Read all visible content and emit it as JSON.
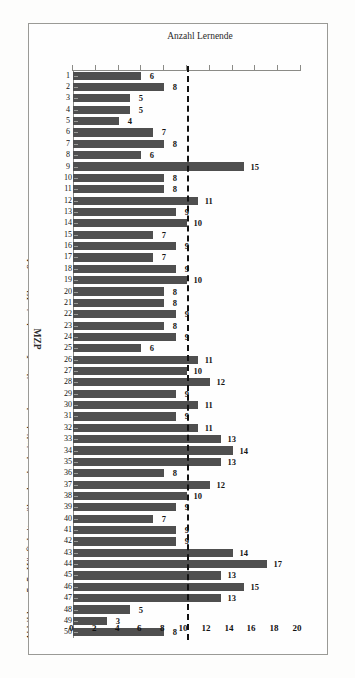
{
  "figure": {
    "caption": "Abbildung 5–5: Häufigkeiten überdurchschnittlich gelangweilter Lernender in Klasse 9A."
  },
  "colors": {
    "bar": "#4f4f4f",
    "reference_line": "#111111",
    "axis": "#8b8b87",
    "background": "#fefefe"
  },
  "chart_data": {
    "type": "bar",
    "title": "",
    "subtitle": "",
    "orientation": "vertical",
    "xlabel": "MZP",
    "ylabel": "Anzahl Lernende",
    "ylim": [
      0,
      20
    ],
    "ytick_labels": [
      "0",
      "2",
      "4",
      "6",
      "8",
      "10",
      "12",
      "14",
      "16",
      "18",
      "20"
    ],
    "ytick_values": [
      0,
      2,
      4,
      6,
      8,
      10,
      12,
      14,
      16,
      18,
      20
    ],
    "grid": false,
    "legend": "none",
    "annotations": [
      {
        "type": "reference-line",
        "style": "dashed",
        "value": 10,
        "label": ""
      }
    ],
    "categories": [
      "1",
      "2",
      "3",
      "4",
      "5",
      "6",
      "7",
      "8",
      "9",
      "10",
      "11",
      "12",
      "13",
      "14",
      "15",
      "16",
      "17",
      "18",
      "19",
      "20",
      "21",
      "22",
      "23",
      "24",
      "25",
      "26",
      "27",
      "28",
      "29",
      "30",
      "31",
      "32",
      "33",
      "34",
      "35",
      "36",
      "37",
      "38",
      "39",
      "40",
      "41",
      "42",
      "43",
      "44",
      "45",
      "46",
      "47",
      "48",
      "49",
      "50"
    ],
    "values": [
      6,
      8,
      5,
      5,
      4,
      7,
      8,
      6,
      15,
      8,
      8,
      11,
      9,
      10,
      7,
      9,
      7,
      9,
      10,
      8,
      8,
      9,
      8,
      9,
      6,
      11,
      10,
      12,
      9,
      11,
      9,
      11,
      13,
      14,
      13,
      8,
      12,
      10,
      9,
      7,
      9,
      9,
      14,
      17,
      13,
      15,
      13,
      5,
      3,
      8
    ],
    "data_labels": [
      "6",
      "8",
      "5",
      "5",
      "4",
      "7",
      "8",
      "6",
      "15",
      "8",
      "8",
      "11",
      "9",
      "10",
      "7",
      "9",
      "7",
      "9",
      "10",
      "8",
      "8",
      "9",
      "8",
      "9",
      "6",
      "11",
      "10",
      "12",
      "9",
      "11",
      "9",
      "11",
      "13",
      "14",
      "13",
      "8",
      "12",
      "10",
      "9",
      "7",
      "9",
      "9",
      "14",
      "17",
      "13",
      "15",
      "13",
      "5",
      "3",
      "8"
    ]
  }
}
